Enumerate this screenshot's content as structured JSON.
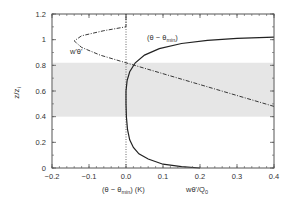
{
  "chart_data": {
    "type": "line",
    "title": "",
    "xlabel_left": "(θ − θ_min) (K)",
    "xlabel_right": "w'θ'/Q_0",
    "ylabel": "z/z_i",
    "xlim": [
      -0.2,
      0.4
    ],
    "ylim": [
      0,
      1.2
    ],
    "x_ticks": [
      "-0.2",
      "-0.1",
      "0.0",
      "0.1",
      "0.2",
      "0.3",
      "0.4"
    ],
    "y_ticks": [
      "0",
      "0.2",
      "0.4",
      "0.6",
      "0.8",
      "1",
      "1.2"
    ],
    "grid": false,
    "shaded_band": {
      "y_from": 0.4,
      "y_to": 0.82,
      "color": "#e6e6e6"
    },
    "reference_line": {
      "x": 0,
      "style": "dotted"
    },
    "series": [
      {
        "name": "(θ − θ_min)",
        "style": "solid",
        "label": "(θ − θmin)",
        "points": [
          [
            0.2,
            0
          ],
          [
            0.15,
            0.01
          ],
          [
            0.1,
            0.03
          ],
          [
            0.06,
            0.07
          ],
          [
            0.035,
            0.11
          ],
          [
            0.02,
            0.16
          ],
          [
            0.01,
            0.22
          ],
          [
            0.004,
            0.3
          ],
          [
            0.001,
            0.4
          ],
          [
            0,
            0.5
          ],
          [
            0,
            0.6
          ],
          [
            0.003,
            0.68
          ],
          [
            0.01,
            0.75
          ],
          [
            0.025,
            0.82
          ],
          [
            0.05,
            0.88
          ],
          [
            0.09,
            0.93
          ],
          [
            0.15,
            0.97
          ],
          [
            0.22,
            0.995
          ],
          [
            0.3,
            1.01
          ],
          [
            0.4,
            1.02
          ]
        ]
      },
      {
        "name": "w'θ'",
        "style": "dash-dot",
        "label": "w'θ'",
        "points": [
          [
            0.4,
            0.48
          ],
          [
            0.3,
            0.565
          ],
          [
            0.2,
            0.65
          ],
          [
            0.1,
            0.735
          ],
          [
            0,
            0.82
          ],
          [
            -0.07,
            0.88
          ],
          [
            -0.12,
            0.94
          ],
          [
            -0.14,
            0.99
          ],
          [
            -0.12,
            1.03
          ],
          [
            -0.06,
            1.07
          ],
          [
            0,
            1.1
          ],
          [
            0,
            1.2
          ]
        ]
      }
    ]
  },
  "labels": {
    "ylabel_main": "z/z",
    "ylabel_sub": "i",
    "xlabel_left_main": "(θ − θ",
    "xlabel_left_sub": "min",
    "xlabel_left_tail": ") (K)",
    "xlabel_right_main": "wθ'/Q",
    "xlabel_right_sub": "0",
    "series_theta_main": "(θ − θ",
    "series_theta_sub": "min",
    "series_theta_tail": ")",
    "series_flux": "w'θ'"
  },
  "colors": {
    "axis": "#555555",
    "curve": "#222222",
    "band": "#e6e6e6"
  }
}
